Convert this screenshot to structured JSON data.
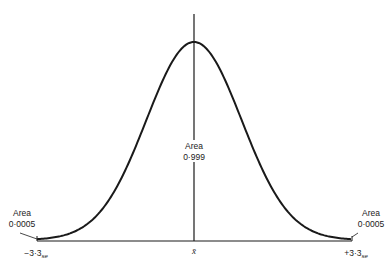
{
  "chart_data": {
    "type": "area",
    "title": "",
    "x_axis": {
      "tick_labels": [
        "-3·3",
        "x̄",
        "+3·3"
      ],
      "tick_subscripts": [
        "se",
        "",
        "se"
      ],
      "range_se": [
        -3.3,
        3.3
      ]
    },
    "annotations": [
      {
        "position": "left-tail",
        "label": "Area",
        "value": "0·0005"
      },
      {
        "position": "center",
        "label": "Area",
        "value": "0·999"
      },
      {
        "position": "right-tail",
        "label": "Area",
        "value": "0·0005"
      }
    ],
    "areas": {
      "left_tail": 0.0005,
      "central": 0.999,
      "right_tail": 0.0005
    },
    "grid": false,
    "legend": null
  },
  "labels": {
    "left": {
      "title": "Area",
      "value": "0·0005",
      "tick": "−3·3",
      "sub": "se"
    },
    "center": {
      "title": "Area",
      "value": "0·999",
      "tick": "x̄"
    },
    "right": {
      "title": "Area",
      "value": "0·0005",
      "tick": "+3·3",
      "sub": "se"
    }
  },
  "colors": {
    "ink": "#1a1a1a",
    "background": "#ffffff"
  }
}
